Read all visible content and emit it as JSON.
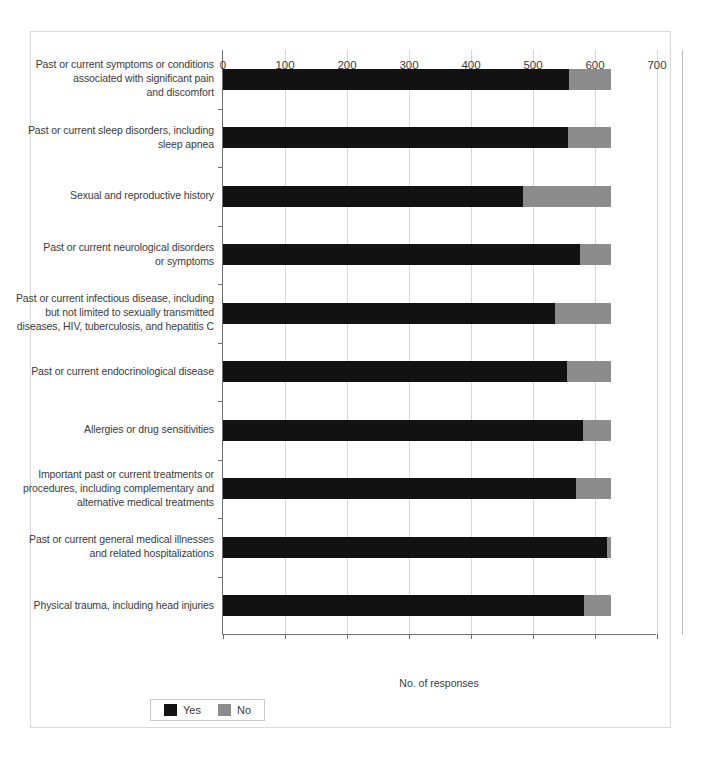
{
  "chart_data": {
    "type": "bar",
    "orientation": "horizontal",
    "stacked": true,
    "title": "",
    "xlabel": "No. of responses",
    "ylabel": "",
    "xlim": [
      0,
      700
    ],
    "xticks": [
      0,
      100,
      200,
      300,
      400,
      500,
      600,
      700
    ],
    "xtick_labels": [
      "0",
      "100",
      "200",
      "300",
      "400",
      "500",
      "600",
      "700"
    ],
    "grid": "vertical",
    "legend_position": "bottom-left",
    "categories": [
      "Past or current symptoms or conditions associated with significant pain and discomfort",
      "Past or current sleep disorders, including sleep apnea",
      "Sexual and reproductive history",
      "Past or current neurological disorders or symptoms",
      "Past or current infectious disease, including but not limited to sexually transmitted diseases, HIV, tuberculosis, and hepatitis C",
      "Past or current endocrinological disease",
      "Allergies or drug sensitivities",
      "Important past or current treatments or procedures, including complementary and alternative medical treatments",
      "Past or current general medical illnesses and related hospitalizations",
      "Physical trauma, including head injuries"
    ],
    "category_lines": [
      [
        "Past or current symptoms or conditions",
        "associated with significant pain",
        "and discomfort"
      ],
      [
        "Past or current sleep disorders, including",
        "sleep apnea"
      ],
      [
        "Sexual and reproductive history"
      ],
      [
        "Past or current neurological disorders",
        "or symptoms"
      ],
      [
        "Past or current infectious disease, including",
        "but not limited to sexually transmitted",
        "diseases, HIV, tuberculosis, and hepatitis C"
      ],
      [
        "Past or current endocrinological disease"
      ],
      [
        "Allergies or drug sensitivities"
      ],
      [
        "Important past or current treatments or",
        "procedures, including complementary and",
        "alternative medical treatments"
      ],
      [
        "Past or current general medical illnesses",
        "and related hospitalizations"
      ],
      [
        "Physical trauma, including head injuries"
      ]
    ],
    "series": [
      {
        "name": "Yes",
        "color": "#121212",
        "values": [
          558,
          556,
          484,
          576,
          535,
          555,
          580,
          569,
          620,
          583
        ]
      },
      {
        "name": "No",
        "color": "#8c8c8c",
        "values": [
          68,
          70,
          142,
          50,
          91,
          71,
          46,
          57,
          6,
          43
        ]
      }
    ],
    "totals": [
      626,
      626,
      626,
      626,
      626,
      626,
      626,
      626,
      626,
      626
    ]
  },
  "legend": {
    "items": [
      {
        "label": "Yes",
        "color": "#121212"
      },
      {
        "label": "No",
        "color": "#8c8c8c"
      }
    ]
  }
}
